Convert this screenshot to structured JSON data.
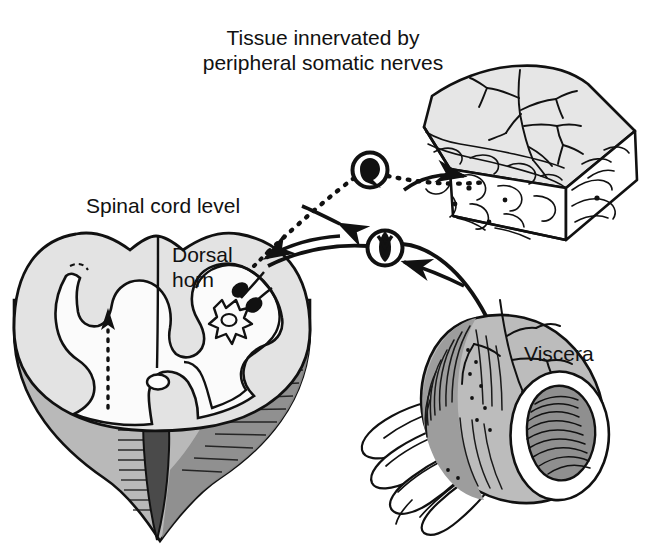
{
  "figure": {
    "type": "anatomical-diagram",
    "width": 645,
    "height": 547,
    "background_color": "#ffffff",
    "ink_color": "#111111"
  },
  "labels": {
    "tissue": "Tissue innervated by\nperipheral somatic nerves",
    "tissue_line1": "Tissue innervated by",
    "tissue_line2": "peripheral somatic nerves",
    "spinal_cord": "Spinal cord level",
    "dorsal_horn": "Dorsal\nhorn",
    "dorsal_horn_line1": "Dorsal",
    "dorsal_horn_line2": "horn",
    "viscera": "Viscera"
  },
  "structures": [
    {
      "name": "spinal-cord-cross-section",
      "description": "Transverse section of spinal cord shown as a 3D block with butterfly-shaped central gray matter, surrounding white matter, central canal, ventral median fissure and shaded cut faces",
      "fill_white_matter": "#e3e3e3",
      "fill_gray_matter": "#fbfbfb",
      "fill_cut_face": "#b5b5b5",
      "fill_fissure": "#4a4a4a"
    },
    {
      "name": "somatic-tissue-block",
      "description": "Wedge-shaped block of skin / somatic tissue with branching peripheral nerve arborization on the upper surface and a layered cut edge",
      "fill_surface": "#e6e6e6",
      "fill_edge": "#ffffff"
    },
    {
      "name": "viscera-segment",
      "description": "Cut segment of hollow viscus (intestine) with mesentery fan, serosal blood vessels and folded mucosal lumen",
      "fill_body": "#bcbcbc",
      "fill_lumen_folds": "#8f8f8f"
    },
    {
      "name": "somatic-afferent-ganglion",
      "description": "Upper circled pseudo-unipolar dorsal root ganglion neuron conveying somatic afferent input",
      "fill": "#000000"
    },
    {
      "name": "visceral-afferent-ganglion",
      "description": "Lower circled pseudo-unipolar dorsal root ganglion neuron conveying visceral afferent input",
      "fill": "#000000"
    },
    {
      "name": "dorsal-horn-projection-neuron",
      "description": "Star-shaped (multipolar) second-order projection neuron in the dorsal horn receiving two black axon terminals",
      "fill": "#fbfbfb"
    }
  ],
  "pathways": [
    {
      "name": "somatic-afferent-pathway",
      "style": "dotted",
      "from": "somatic tissue block",
      "to": "dorsal horn",
      "via": "somatic-afferent-ganglion"
    },
    {
      "name": "visceral-afferent-pathway",
      "style": "solid",
      "from": "viscera",
      "to": "dorsal horn",
      "via": "visceral-afferent-ganglion"
    },
    {
      "name": "ascending-tract",
      "style": "dotted-arrow",
      "description": "Dotted arrow ascending within the contralateral white matter of the spinal cord",
      "direction": "up"
    }
  ]
}
